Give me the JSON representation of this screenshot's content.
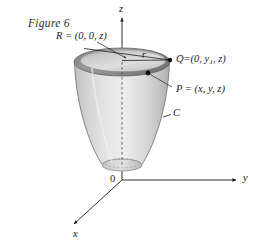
{
  "figure": {
    "caption": "Figure 6",
    "background_color": "#ffffff",
    "ink_color": "#1a1a1a",
    "surface_fill_light": "#e8e8e8",
    "surface_fill_mid": "#d2d2d2",
    "surface_fill_dark": "#a8a8a8",
    "rim_dark": "#8f8f8f"
  },
  "axes": {
    "z_label": "z",
    "y_label": "y",
    "x_label": "x",
    "origin_label": "0"
  },
  "labels": {
    "point_r": {
      "name": "R",
      "equals": "=",
      "coords": "(0, 0, z)",
      "full": "R = (0, 0, z)"
    },
    "point_q": {
      "name": "Q",
      "equals": "=",
      "coords_prefix": "(0, y",
      "coords_sub": "1",
      "coords_suffix": ", z)",
      "full": "Q = (0, y1, z)"
    },
    "point_p": {
      "name": "P",
      "equals": "=",
      "coords": "(x, y, z)",
      "full": "P = (x, y, z)"
    },
    "radius": "r",
    "curve": "C"
  },
  "geometry": {
    "top_ellipse_center": [
      122,
      62
    ],
    "top_ellipse_rx": 48,
    "top_ellipse_ry": 14,
    "bottom_ellipse_center": [
      122,
      165
    ],
    "bottom_ellipse_rx": 20,
    "bottom_ellipse_ry": 6,
    "origin_point": [
      122,
      180
    ],
    "point_q_dot": [
      170,
      60
    ],
    "point_p_dot": [
      148,
      73
    ],
    "point_r_arrow_tip": [
      124,
      57
    ]
  }
}
